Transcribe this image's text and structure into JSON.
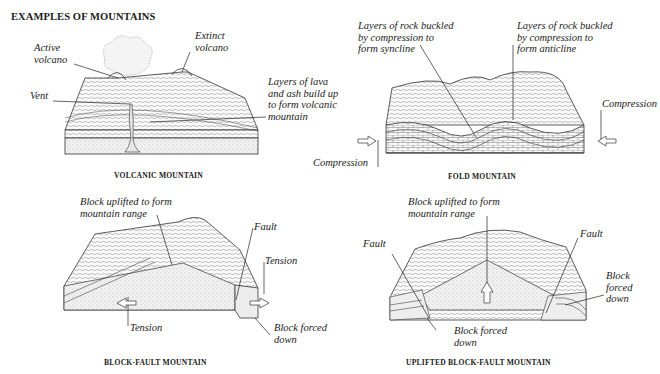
{
  "title": "EXAMPLES OF MOUNTAINS",
  "panels": {
    "volcanic": {
      "caption": "VOLCANIC MOUNTAIN",
      "labels": {
        "active_volcano": "Active\nvolcano",
        "extinct_volcano": "Extinct\nvolcano",
        "vent": "Vent",
        "lava_layers": "Layers of lava\nand ash build up\nto form volcanic\nmountain"
      }
    },
    "fold": {
      "caption": "FOLD MOUNTAIN",
      "labels": {
        "syncline": "Layers of rock buckled\nby compression to\nform syncline",
        "anticline": "Layers of rock buckled\nby compression to\nform anticline",
        "compression_left": "Compression",
        "compression_right": "Compression"
      }
    },
    "block_fault": {
      "caption": "BLOCK-FAULT MOUNTAIN",
      "labels": {
        "uplifted": "Block uplifted to form\nmountain range",
        "fault": "Fault",
        "tension_right": "Tension",
        "tension_left": "Tension",
        "forced_down": "Block forced\ndown"
      }
    },
    "uplifted_block_fault": {
      "caption": "UPLIFTED BLOCK-FAULT MOUNTAIN",
      "labels": {
        "uplifted": "Block uplifted to form\nmountain range",
        "fault_left": "Fault",
        "fault_right": "Fault",
        "forced_down_right": "Block\nforced\ndown",
        "forced_down_bottom": "Block forced\ndown"
      }
    }
  }
}
